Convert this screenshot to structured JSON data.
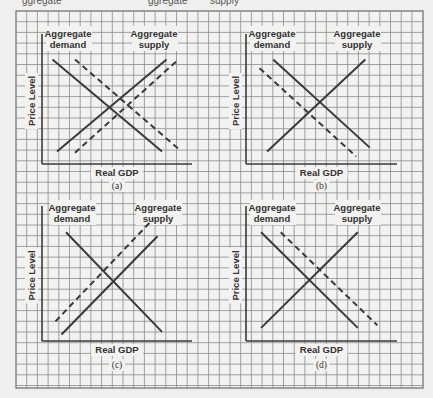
{
  "top_strip": {
    "fragments": [
      "ggregate",
      "ggregate",
      "supply"
    ]
  },
  "chart_data": [
    {
      "type": "line",
      "panel": "a",
      "caption": "(a)",
      "xlabel": "Real GDP",
      "ylabel": "Price Level",
      "labels": {
        "demand": "Aggregate demand",
        "supply": "Aggregate supply"
      },
      "grid": true,
      "series": [
        {
          "name": "Aggregate demand",
          "style": "solid",
          "points": [
            [
              0.07,
              0.83
            ],
            [
              0.8,
              0.1
            ]
          ]
        },
        {
          "name": "Aggregate demand (shifted)",
          "style": "dashed",
          "points": [
            [
              0.22,
              0.83
            ],
            [
              0.91,
              0.12
            ]
          ]
        },
        {
          "name": "Aggregate supply",
          "style": "solid",
          "points": [
            [
              0.1,
              0.1
            ],
            [
              0.83,
              0.83
            ]
          ]
        },
        {
          "name": "Aggregate supply (shifted)",
          "style": "dashed",
          "points": [
            [
              0.22,
              0.09
            ],
            [
              0.91,
              0.83
            ]
          ]
        }
      ],
      "shift": "Both AD and AS shift right"
    },
    {
      "type": "line",
      "panel": "b",
      "caption": "(b)",
      "xlabel": "Real GDP",
      "ylabel": "Price Level",
      "labels": {
        "demand": "Aggregate demand",
        "supply": "Aggregate supply"
      },
      "grid": true,
      "series": [
        {
          "name": "Aggregate demand",
          "style": "solid",
          "points": [
            [
              0.18,
              0.83
            ],
            [
              0.82,
              0.13
            ]
          ]
        },
        {
          "name": "Aggregate demand (shifted)",
          "style": "dashed",
          "points": [
            [
              0.09,
              0.76
            ],
            [
              0.73,
              0.06
            ]
          ]
        },
        {
          "name": "Aggregate supply",
          "style": "solid",
          "points": [
            [
              0.14,
              0.1
            ],
            [
              0.79,
              0.83
            ]
          ]
        }
      ],
      "shift": "AD shifts left"
    },
    {
      "type": "line",
      "panel": "c",
      "caption": "(c)",
      "xlabel": "Real GDP",
      "ylabel": "Price Level",
      "labels": {
        "demand": "Aggregate demand",
        "supply": "Aggregate supply"
      },
      "grid": true,
      "series": [
        {
          "name": "Aggregate demand",
          "style": "solid",
          "points": [
            [
              0.16,
              0.83
            ],
            [
              0.8,
              0.07
            ]
          ]
        },
        {
          "name": "Aggregate supply",
          "style": "solid",
          "points": [
            [
              0.13,
              0.05
            ],
            [
              0.77,
              0.8
            ]
          ]
        },
        {
          "name": "Aggregate supply (shifted)",
          "style": "dashed",
          "points": [
            [
              0.09,
              0.15
            ],
            [
              0.74,
              0.93
            ]
          ]
        }
      ],
      "shift": "AS shifts left"
    },
    {
      "type": "line",
      "panel": "d",
      "caption": "(d)",
      "xlabel": "Real GDP",
      "ylabel": "Price Level",
      "labels": {
        "demand": "Aggregate demand",
        "supply": "Aggregate supply"
      },
      "grid": true,
      "series": [
        {
          "name": "Aggregate demand",
          "style": "solid",
          "points": [
            [
              0.1,
              0.83
            ],
            [
              0.74,
              0.1
            ]
          ]
        },
        {
          "name": "Aggregate demand (shifted)",
          "style": "dashed",
          "points": [
            [
              0.23,
              0.83
            ],
            [
              0.87,
              0.12
            ]
          ]
        },
        {
          "name": "Aggregate supply",
          "style": "solid",
          "points": [
            [
              0.1,
              0.1
            ],
            [
              0.74,
              0.83
            ]
          ]
        }
      ],
      "shift": "AD shifts right"
    }
  ]
}
